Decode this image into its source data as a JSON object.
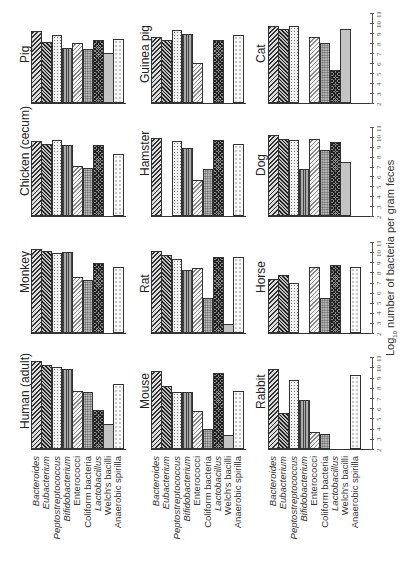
{
  "chart_data": {
    "type": "bar",
    "orientation_note": "figure printed rotated 90 degrees counter-clockwise",
    "ylabel": "Log10 number of bacteria per gram feces",
    "ylim": [
      2,
      11
    ],
    "yticks": [
      "2",
      "3",
      "4",
      "5",
      "6",
      "7",
      "8",
      "9",
      "10",
      "11"
    ],
    "categories": [
      "Bacteroides",
      "Eubacterium",
      "Peptostreptococcus",
      "Bifidobacterium",
      "Enterococci",
      "Coliform bacteria",
      "Lactobacillus",
      "Welch's bacilli",
      "Anaerobic spirilla"
    ],
    "italic_categories": [
      0,
      1,
      2,
      3,
      6
    ],
    "panels": [
      {
        "name": "Human (adult)",
        "values": [
          10.6,
          10.2,
          10.0,
          9.8,
          7.7,
          7.6,
          5.8,
          4.5,
          8.4
        ]
      },
      {
        "name": "Monkey",
        "values": [
          10.3,
          10.1,
          9.9,
          10.0,
          7.5,
          7.2,
          8.9,
          null,
          8.5
        ]
      },
      {
        "name": "Chicken (cecum)",
        "values": [
          9.6,
          9.3,
          9.7,
          9.2,
          7.1,
          6.9,
          9.2,
          null,
          8.3
        ]
      },
      {
        "name": "Pig",
        "values": [
          9.2,
          8.1,
          8.8,
          7.5,
          8.0,
          7.4,
          8.3,
          7.0,
          8.4
        ]
      },
      {
        "name": "Mouse",
        "values": [
          9.6,
          8.2,
          7.6,
          7.6,
          5.7,
          4.0,
          9.5,
          3.4,
          7.7
        ]
      },
      {
        "name": "Rat",
        "values": [
          10.1,
          9.7,
          9.3,
          8.2,
          8.4,
          5.5,
          9.5,
          2.9,
          9.5
        ]
      },
      {
        "name": "Hamster",
        "values": [
          9.9,
          null,
          9.6,
          8.9,
          5.6,
          6.7,
          9.7,
          null,
          9.3
        ]
      },
      {
        "name": "Guinea pig",
        "values": [
          8.6,
          8.3,
          9.3,
          8.9,
          6.0,
          null,
          8.3,
          null,
          8.8
        ]
      },
      {
        "name": "Rabbit",
        "values": [
          9.8,
          5.5,
          8.8,
          6.8,
          3.7,
          3.5,
          null,
          null,
          9.3
        ]
      },
      {
        "name": "Horse",
        "values": [
          7.3,
          7.7,
          7.0,
          null,
          8.5,
          5.5,
          8.7,
          null,
          8.5
        ]
      },
      {
        "name": "Dog",
        "values": [
          10.2,
          9.8,
          9.7,
          6.7,
          9.8,
          8.7,
          9.5,
          7.5,
          null
        ]
      },
      {
        "name": "Cat",
        "values": [
          9.7,
          9.4,
          9.7,
          null,
          8.6,
          8.0,
          5.3,
          9.4,
          null
        ]
      }
    ],
    "grid": false,
    "legend": "none (category labels under bottom row of each column)"
  },
  "labels": {
    "ylabel_prefix": "Log",
    "ylabel_sub": "10",
    "ylabel_rest": " number of bacteria per gram feces"
  }
}
